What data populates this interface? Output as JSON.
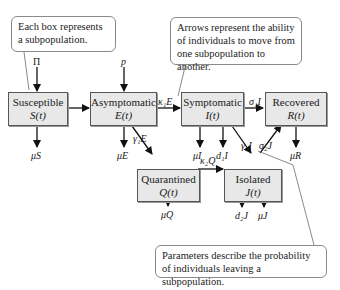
{
  "callouts": {
    "boxes": "Each box represents a subpopulation.",
    "arrows": "Arrows represent the ability of individuals to move from one subpopulation to another.",
    "parameters": "Parameters describe the probability of individuals leaving a subpopulation."
  },
  "boxes": {
    "susceptible": {
      "name": "Susceptible",
      "var": "S(t)"
    },
    "asymptomatic": {
      "name": "Asymptomatic",
      "var": "E(t)"
    },
    "symptomatic": {
      "name": "Symptomatic",
      "var": "I(t)"
    },
    "recovered": {
      "name": "Recovered",
      "var": "R(t)"
    },
    "quarantined": {
      "name": "Quarantined",
      "var": "Q(t)"
    },
    "isolated": {
      "name": "Isolated",
      "var": "J(t)"
    }
  },
  "flows": {
    "pi": "Π",
    "p": "p",
    "k1E": "κ₁E",
    "s1I": "σ₁I",
    "g1E": "γ₁E",
    "g2I": "γ₂I",
    "s2J": "σ₂J",
    "k2Q": "κ₂Q",
    "muS": "μS",
    "muE": "μE",
    "muI": "μI",
    "d1I": "d₁I",
    "muR": "μR",
    "muQ": "μQ",
    "d2J": "d₂J",
    "muJ": "μJ"
  }
}
